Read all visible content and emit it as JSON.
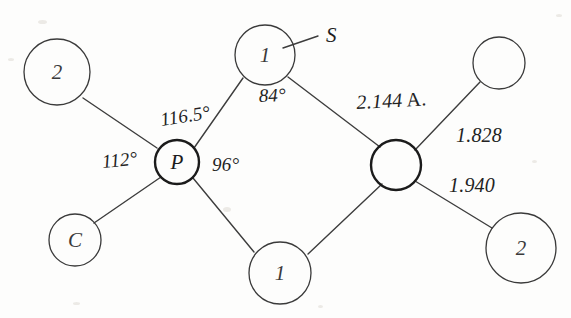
{
  "figure": {
    "background_color": "#fdfdfc",
    "ink_color": "#3a3a3a",
    "heavy_ink_color": "#1b1b1b"
  },
  "atoms": [
    {
      "id": "atom-top-left",
      "label": "2",
      "cx": 57,
      "cy": 72,
      "r": 33,
      "weight": "light"
    },
    {
      "id": "atom-bottom-left",
      "label": "C",
      "cx": 75,
      "cy": 240,
      "r": 26,
      "weight": "light"
    },
    {
      "id": "atom-phosphorus",
      "label": "P",
      "cx": 177,
      "cy": 162,
      "r": 22,
      "weight": "heavy"
    },
    {
      "id": "atom-top-bridge",
      "label": "1",
      "cx": 265,
      "cy": 55,
      "r": 30,
      "weight": "light"
    },
    {
      "id": "atom-bottom-bridge",
      "label": "1",
      "cx": 280,
      "cy": 273,
      "r": 31,
      "weight": "light"
    },
    {
      "id": "atom-center-right",
      "label": "",
      "cx": 396,
      "cy": 165,
      "r": 25,
      "weight": "heavy"
    },
    {
      "id": "atom-top-right",
      "label": "",
      "cx": 499,
      "cy": 63,
      "r": 26,
      "weight": "light"
    },
    {
      "id": "atom-bottom-right",
      "label": "2",
      "cx": 521,
      "cy": 248,
      "r": 35,
      "weight": "light"
    }
  ],
  "bonds": [
    {
      "id": "bond-2-to-p",
      "x1": 83,
      "y1": 98,
      "x2": 157,
      "y2": 148
    },
    {
      "id": "bond-c-to-p",
      "x1": 94,
      "y1": 223,
      "x2": 161,
      "y2": 177
    },
    {
      "id": "bond-p-to-top1",
      "x1": 194,
      "y1": 148,
      "x2": 243,
      "y2": 78
    },
    {
      "id": "bond-p-to-bottom1",
      "x1": 193,
      "y1": 178,
      "x2": 254,
      "y2": 252
    },
    {
      "id": "bond-top1-to-center",
      "x1": 288,
      "y1": 77,
      "x2": 380,
      "y2": 147
    },
    {
      "id": "bond-bottom1-to-center",
      "x1": 308,
      "y1": 254,
      "x2": 382,
      "y2": 184
    },
    {
      "id": "bond-center-to-topright",
      "x1": 415,
      "y1": 150,
      "x2": 480,
      "y2": 82
    },
    {
      "id": "bond-center-to-bottomright",
      "x1": 415,
      "y1": 181,
      "x2": 492,
      "y2": 228
    },
    {
      "id": "bond-leader-sulfur",
      "x1": 283,
      "y1": 48,
      "x2": 318,
      "y2": 36
    }
  ],
  "angles": [
    {
      "id": "angle-116-5",
      "value": "116.5°",
      "x": 162,
      "y": 110
    },
    {
      "id": "angle-112",
      "value": "112°",
      "x": 103,
      "y": 152
    },
    {
      "id": "angle-96",
      "value": "96°",
      "x": 212,
      "y": 155
    },
    {
      "id": "angle-84",
      "value": "84°",
      "x": 259,
      "y": 86
    }
  ],
  "distances": [
    {
      "id": "distance-2-144",
      "value": "2.144",
      "unit": "A.",
      "x": 357,
      "y": 92
    },
    {
      "id": "distance-1-828",
      "value": "1.828",
      "unit": "",
      "x": 456,
      "y": 125
    },
    {
      "id": "distance-1-940",
      "value": "1.940",
      "unit": "",
      "x": 449,
      "y": 175
    }
  ],
  "element_labels": [
    {
      "id": "element-sulfur",
      "value": "S",
      "x": 326,
      "y": 25
    }
  ],
  "specks": [
    {
      "x": 8,
      "y": 58,
      "w": 6,
      "h": 3
    },
    {
      "x": 38,
      "y": 20,
      "w": 9,
      "h": 4
    },
    {
      "x": 223,
      "y": 207,
      "w": 8,
      "h": 5
    },
    {
      "x": 556,
      "y": 14,
      "w": 6,
      "h": 3
    },
    {
      "x": 532,
      "y": 160,
      "w": 5,
      "h": 3
    },
    {
      "x": 73,
      "y": 302,
      "w": 7,
      "h": 3
    },
    {
      "x": 318,
      "y": 305,
      "w": 5,
      "h": 3
    }
  ]
}
